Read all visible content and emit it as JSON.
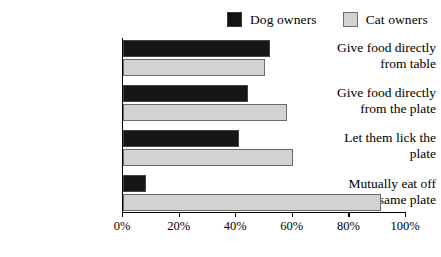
{
  "chart_data": {
    "type": "bar",
    "orientation": "horizontal",
    "title": "",
    "subtitle": "",
    "xlabel": "",
    "ylabel": "",
    "xlim": [
      0,
      100
    ],
    "grid": false,
    "legend_position": "top-right",
    "categories": [
      "Give food directly from table",
      "Give food directly from the plate",
      "Let them lick the plate",
      "Mutually eat off the same plate"
    ],
    "category_lines": [
      [
        "Give food directly",
        "from table"
      ],
      [
        "Give food directly",
        "from the plate"
      ],
      [
        "Let them lick the",
        "plate"
      ],
      [
        "Mutually eat off",
        "the same plate"
      ]
    ],
    "series": [
      {
        "name": "Dog owners",
        "color": "#161616",
        "values": [
          52,
          44,
          41,
          8
        ]
      },
      {
        "name": "Cat owners",
        "color": "#d2d2d2",
        "values": [
          50,
          58,
          60,
          91
        ]
      }
    ],
    "xticks": [
      0,
      20,
      40,
      60,
      80,
      100
    ],
    "xticklabels": [
      "0%",
      "20%",
      "40%",
      "60%",
      "80%",
      "100%"
    ]
  },
  "legend": {
    "entries": [
      {
        "label": "Dog owners",
        "swatch": "dog-owners-swatch"
      },
      {
        "label": "Cat owners",
        "swatch": "cat-owners-swatch"
      }
    ]
  },
  "axis": {
    "ticklabels": [
      "0%",
      "20%",
      "40%",
      "60%",
      "80%",
      "100%"
    ]
  },
  "colors": {
    "dog": "#161616",
    "cat": "#d2d2d2",
    "axis": "#000000",
    "background": "#ffffff"
  }
}
